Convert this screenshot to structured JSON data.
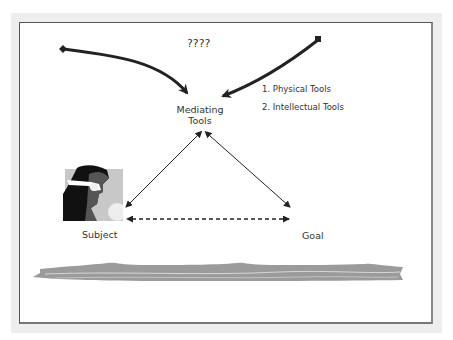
{
  "diagram": {
    "question_label": "????",
    "mediating_tools_label_line1": "Mediating",
    "mediating_tools_label_line2": "Tools",
    "tool_types": [
      {
        "label": "1. Physical Tools"
      },
      {
        "label": "2. Intellectual Tools"
      }
    ],
    "subject_label": "Subject",
    "goal_label": "Goal",
    "icons": {
      "subject_image": "person-with-goggles-icon",
      "left_arrow_start": "diamond-marker-icon",
      "right_arrow_start": "square-marker-icon",
      "river": "river-band-icon"
    },
    "colors": {
      "frame": "#eeeeee",
      "border": "#555555",
      "arrow": "#222222",
      "river": "#999999",
      "text": "#333333"
    }
  }
}
